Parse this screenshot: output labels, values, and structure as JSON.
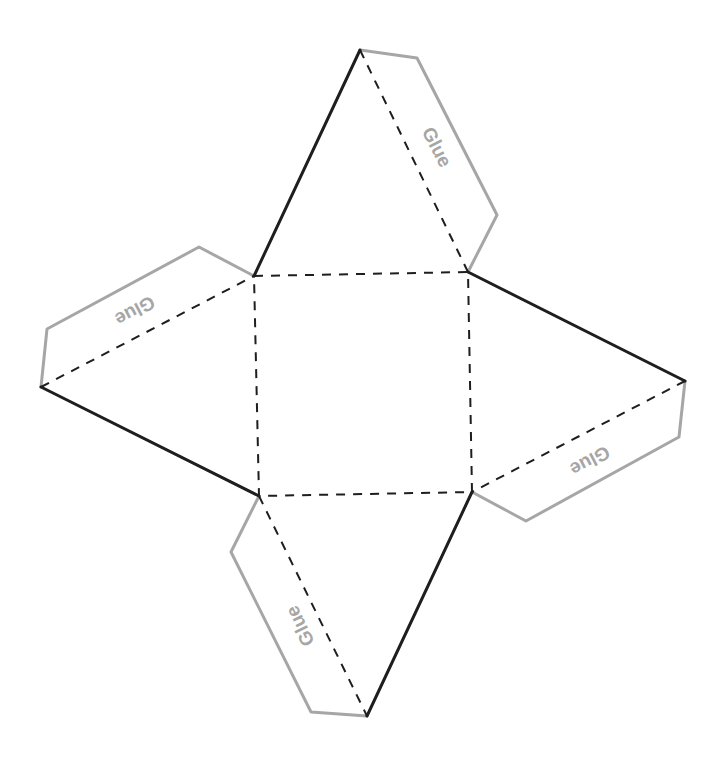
{
  "diagram": {
    "colors": {
      "cut_line": "#1e1e1e",
      "fold_line": "#1e1e1e",
      "glue_flap": "#a6a6a6",
      "glue_text": "#a6a6a6",
      "background": "#ffffff"
    },
    "base_square": {
      "corners": [
        [
          254,
          276
        ],
        [
          468,
          272
        ],
        [
          472,
          492
        ],
        [
          259,
          496
        ]
      ]
    },
    "apexes": {
      "top": [
        360,
        50
      ],
      "right": [
        685,
        381
      ],
      "bottom": [
        367,
        716
      ],
      "left": [
        41,
        387
      ]
    },
    "glue_flaps": [
      {
        "id": "top",
        "label": "Glue",
        "points": [
          [
            360,
            50
          ],
          [
            417,
            58
          ],
          [
            497,
            215
          ],
          [
            468,
            272
          ]
        ],
        "label_pos": [
          437,
          147
        ],
        "rotation": 63
      },
      {
        "id": "right",
        "label": "Glue",
        "points": [
          [
            685,
            381
          ],
          [
            679,
            437
          ],
          [
            526,
            521
          ],
          [
            472,
            492
          ]
        ],
        "label_pos": [
          590,
          461
        ],
        "rotation": 152
      },
      {
        "id": "bottom",
        "label": "Glue",
        "points": [
          [
            259,
            496
          ],
          [
            231,
            552
          ],
          [
            311,
            712
          ],
          [
            367,
            716
          ]
        ],
        "label_pos": [
          300,
          626
        ],
        "rotation": -116
      },
      {
        "id": "left",
        "label": "Glue",
        "points": [
          [
            41,
            387
          ],
          [
            47,
            329
          ],
          [
            199,
            247
          ],
          [
            254,
            276
          ]
        ],
        "label_pos": [
          135,
          311
        ],
        "rotation": 152
      }
    ]
  }
}
